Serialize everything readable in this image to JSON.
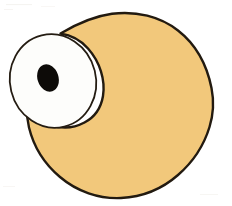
{
  "canvas": {
    "width": 232,
    "height": 206,
    "background_color": "#FFFFFF",
    "title": "Cartoon creature head with one large eye",
    "medium": "hand-drawn ink and marker illustration"
  },
  "palette": {
    "background": "#FFFFFF",
    "body_fill": "#F2C87B",
    "body_outline": "#221A10",
    "eye_sclera_fill": "#FDFDFB",
    "eye_outline": "#241C12",
    "pupil_fill": "#0D0B08",
    "paper_noise": "#F6F4F0"
  },
  "shapes": {
    "body": {
      "name": "body-blob",
      "description": "large rounded blob forming the creature head, flattened slightly on the right side, with a concave cusp at the upper left where it meets the eye",
      "fill": "#F2C87B",
      "stroke": "#221A10",
      "stroke_width": 2.4,
      "bounds": {
        "x": 26,
        "y": 12,
        "width": 188,
        "height": 187
      }
    },
    "eye": {
      "name": "eye-ellipse",
      "description": "large tilted oval eye protruding past the left edge of the body",
      "fill": "#FDFDFB",
      "stroke": "#241C12",
      "stroke_width": 1.8,
      "center": {
        "cx": 53,
        "cy": 81
      },
      "radii": {
        "rx": 43,
        "ry": 47
      },
      "rotation_deg": -14
    },
    "pupil": {
      "name": "pupil-ellipse",
      "description": "small black tilted oval pupil in the upper inner area of the eye",
      "fill": "#0D0B08",
      "stroke": "none",
      "center": {
        "cx": 48,
        "cy": 78
      },
      "radii": {
        "rx": 10.5,
        "ry": 14
      },
      "rotation_deg": -18
    }
  },
  "annotations": {
    "figure_label": "Cartoon creature head with one large eye"
  }
}
